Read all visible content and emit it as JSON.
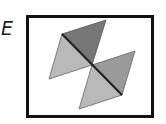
{
  "option": {
    "label": "E"
  },
  "figure": {
    "colors": {
      "border": "#111111",
      "dark": "#777777",
      "medium": "#9a9a9a",
      "light": "#b9b9b9",
      "edge": "#222222"
    },
    "triangles": [
      {
        "name": "top",
        "shade": "dark",
        "points": [
          [
            62,
            34
          ],
          [
            106,
            20
          ],
          [
            92,
            65
          ]
        ]
      },
      {
        "name": "left",
        "shade": "light",
        "points": [
          [
            62,
            34
          ],
          [
            49,
            79
          ],
          [
            92,
            65
          ]
        ]
      },
      {
        "name": "right",
        "shade": "medium",
        "points": [
          [
            92,
            65
          ],
          [
            135,
            51
          ],
          [
            122,
            95
          ]
        ]
      },
      {
        "name": "bottom",
        "shade": "light",
        "points": [
          [
            92,
            65
          ],
          [
            122,
            95
          ],
          [
            79,
            109
          ]
        ]
      }
    ]
  }
}
